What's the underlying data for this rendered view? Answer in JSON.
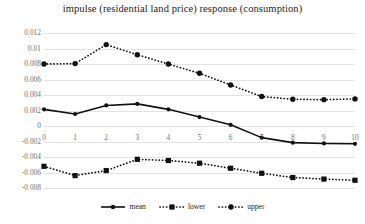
{
  "chart_data": {
    "type": "line",
    "title": "impulse (residential land price)  response (consumption)",
    "xlabel": "",
    "ylabel": "",
    "x": [
      0,
      1,
      2,
      3,
      4,
      5,
      6,
      7,
      8,
      9,
      10
    ],
    "xtick_labels": [
      "0",
      "1",
      "2",
      "3",
      "4",
      "5",
      "6",
      "7",
      "8",
      "9",
      "10"
    ],
    "ytick_labels": [
      "0.012",
      "0.01",
      "0.008",
      "0.006",
      "0.004",
      "0.002",
      "0",
      "-0.002",
      "-0.004",
      "-0.006",
      "-0.008"
    ],
    "ytick_values": [
      0.012,
      0.01,
      0.008,
      0.006,
      0.004,
      0.002,
      0,
      -0.002,
      -0.004,
      -0.006,
      -0.008
    ],
    "ylim": [
      -0.008,
      0.012
    ],
    "xlim": [
      0,
      10
    ],
    "grid": true,
    "legend_position": "bottom",
    "series": [
      {
        "name": "mean",
        "style": "solid",
        "marker": "circle",
        "color": "#111111",
        "values": [
          0.00215,
          0.00155,
          0.00265,
          0.00285,
          0.00215,
          0.00115,
          0.00015,
          -0.0015,
          -0.00215,
          -0.00225,
          -0.0023
        ]
      },
      {
        "name": "lower",
        "style": "dotted",
        "marker": "square",
        "color": "#111111",
        "values": [
          -0.0052,
          -0.0064,
          -0.00575,
          -0.0043,
          -0.00445,
          -0.0048,
          -0.00545,
          -0.0061,
          -0.00665,
          -0.00685,
          -0.007
        ]
      },
      {
        "name": "upper",
        "style": "dotted",
        "marker": "circle",
        "color": "#111111",
        "values": [
          0.008,
          0.00805,
          0.0105,
          0.0092,
          0.008,
          0.0068,
          0.0053,
          0.0038,
          0.00345,
          0.0034,
          0.0035
        ]
      }
    ]
  },
  "legend": {
    "items": [
      {
        "label": "mean"
      },
      {
        "label": "lower"
      },
      {
        "label": "upper"
      }
    ]
  }
}
